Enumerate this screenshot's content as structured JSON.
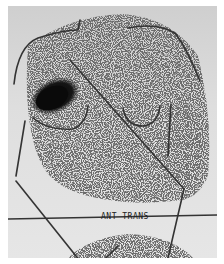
{
  "image": {
    "label": "ANT TRANS",
    "colors": {
      "background": "#dcdcdc",
      "counts": "#2a2a2a",
      "hotspot": "#0a0a0a",
      "markers": "#333333"
    }
  }
}
